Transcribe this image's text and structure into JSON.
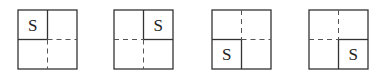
{
  "diagram": {
    "panels": [
      {
        "id": "panel-1",
        "s_position": "top-left",
        "label": "S"
      },
      {
        "id": "panel-2",
        "s_position": "top-right",
        "label": "S"
      },
      {
        "id": "panel-3",
        "s_position": "bottom-left",
        "label": "S"
      },
      {
        "id": "panel-4",
        "s_position": "bottom-right",
        "label": "S"
      }
    ]
  }
}
